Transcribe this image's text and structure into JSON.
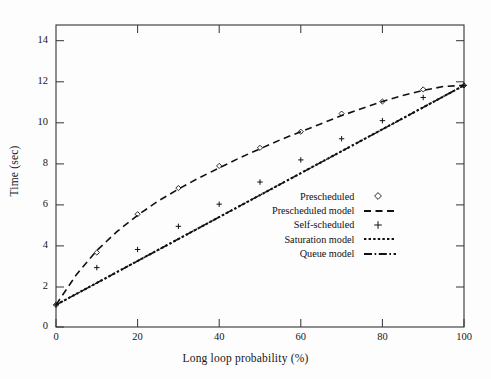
{
  "chart_data": {
    "type": "scatter",
    "title": "",
    "xlabel": "Long loop probability (%)",
    "ylabel": "Time (sec)",
    "xlim": [
      0,
      100
    ],
    "ylim": [
      0,
      15
    ],
    "xticks": [
      0,
      20,
      40,
      60,
      80,
      100
    ],
    "yticks": [
      0,
      2,
      4,
      6,
      8,
      10,
      12,
      14
    ],
    "xtick_labels": [
      "0",
      "20",
      "40",
      "60",
      "80",
      "100"
    ],
    "ytick_labels": [
      "0",
      "2",
      "4",
      "6",
      "8",
      "10",
      "12",
      "14"
    ],
    "grid": false,
    "legend_position": "center-right",
    "series": [
      {
        "name": "Prescheduled",
        "style": "markers",
        "marker": "open-diamond",
        "x": [
          0,
          10,
          20,
          30,
          40,
          50,
          60,
          70,
          80,
          90,
          100
        ],
        "y": [
          1.1,
          3.7,
          5.6,
          6.9,
          8.0,
          8.9,
          9.7,
          10.6,
          11.2,
          11.8,
          12.0
        ]
      },
      {
        "name": "Prescheduled model",
        "style": "dashed-line",
        "x": [
          0,
          5,
          10,
          15,
          20,
          25,
          30,
          35,
          40,
          45,
          50,
          55,
          60,
          65,
          70,
          75,
          80,
          85,
          90,
          95,
          100
        ],
        "y": [
          1.1,
          2.6,
          3.8,
          4.75,
          5.55,
          6.25,
          6.85,
          7.4,
          7.9,
          8.4,
          8.85,
          9.3,
          9.7,
          10.1,
          10.5,
          10.85,
          11.2,
          11.5,
          11.75,
          11.95,
          12.0
        ]
      },
      {
        "name": "Self-scheduled",
        "style": "markers",
        "marker": "plus",
        "x": [
          0,
          10,
          20,
          30,
          40,
          50,
          60,
          70,
          80,
          90,
          100
        ],
        "y": [
          1.1,
          2.95,
          3.85,
          5.0,
          6.1,
          7.2,
          8.3,
          9.35,
          10.25,
          11.4,
          12.0
        ]
      },
      {
        "name": "Saturation model",
        "style": "dotted-line",
        "x": [
          0,
          100
        ],
        "y": [
          1.1,
          12.0
        ]
      },
      {
        "name": "Queue model",
        "style": "dashdot-line",
        "x": [
          0,
          100
        ],
        "y": [
          1.1,
          12.0
        ]
      }
    ]
  },
  "axes": {
    "xlabel": "Long loop probability (%)",
    "ylabel": "Time (sec)"
  },
  "legend": {
    "items": [
      {
        "label": "Prescheduled",
        "key": "open-diamond-marker"
      },
      {
        "label": "Prescheduled model",
        "key": "dashed-line"
      },
      {
        "label": "Self-scheduled",
        "key": "plus-marker"
      },
      {
        "label": "Saturation model",
        "key": "dotted-line"
      },
      {
        "label": "Queue model",
        "key": "dashdot-line"
      }
    ]
  },
  "ticks": {
    "y": [
      "14",
      "12",
      "10",
      "8",
      "6",
      "4",
      "2",
      "0"
    ],
    "x": [
      "0",
      "20",
      "40",
      "60",
      "80",
      "100"
    ]
  },
  "colors": {
    "ink": "#111111",
    "background": "#fdfdfd",
    "frame": "#333333"
  }
}
